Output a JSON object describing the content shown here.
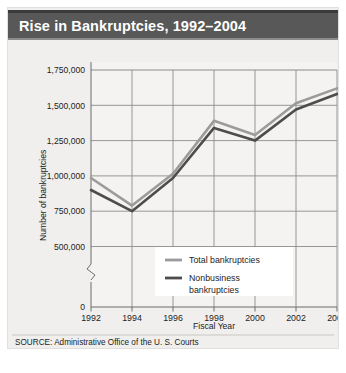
{
  "figure": {
    "title": "Rise in Bankruptcies, 1992–2004",
    "source": "SOURCE: Administrative Office of the U. S. Courts"
  },
  "chart_data": {
    "type": "line",
    "title": "Rise in Bankruptcies, 1992–2004",
    "xlabel": "Fiscal Year",
    "ylabel": "Number of bankruptcies",
    "x": [
      1992,
      1994,
      1996,
      1998,
      2000,
      2002,
      2004
    ],
    "xtick_labels": [
      "1992",
      "1994",
      "1996",
      "1998",
      "2000",
      "2002",
      "2004"
    ],
    "ytick_labels": [
      "0",
      "500,000",
      "750,000",
      "1,000,000",
      "1,250,000",
      "1,500,000",
      "1,750,000"
    ],
    "ytick_values": [
      0,
      500000,
      750000,
      1000000,
      1250000,
      1500000,
      1750000
    ],
    "ylim": [
      500000,
      1750000
    ],
    "xlim": [
      1992,
      2004
    ],
    "axis_break": true,
    "axis_break_note": "y-axis broken between 0 and 500,000",
    "grid": true,
    "legend_position": "inside-lower-center",
    "series": [
      {
        "name": "Total bankruptcies",
        "color": "#9b9b9b",
        "values": [
          985000,
          790000,
          1015000,
          1390000,
          1290000,
          1515000,
          1620000
        ]
      },
      {
        "name": "Nonbusiness bankruptcies",
        "color": "#4d4d4d",
        "values": [
          900000,
          750000,
          985000,
          1340000,
          1250000,
          1470000,
          1580000
        ]
      }
    ]
  },
  "legend": {
    "entries": [
      {
        "label": "Total bankruptcies"
      },
      {
        "label": "Nonbusiness bankruptcies_line1"
      }
    ],
    "entry_1_label": "Total bankruptcies",
    "entry_2_label_line1": "Nonbusiness",
    "entry_2_label_line2": "bankruptcies"
  },
  "colors": {
    "title_bar": "#585858",
    "plot_bg": "#f0efed",
    "grid": "#8c8c8c",
    "total_series": "#9b9b9b",
    "nonbusiness_series": "#4d4d4d"
  }
}
